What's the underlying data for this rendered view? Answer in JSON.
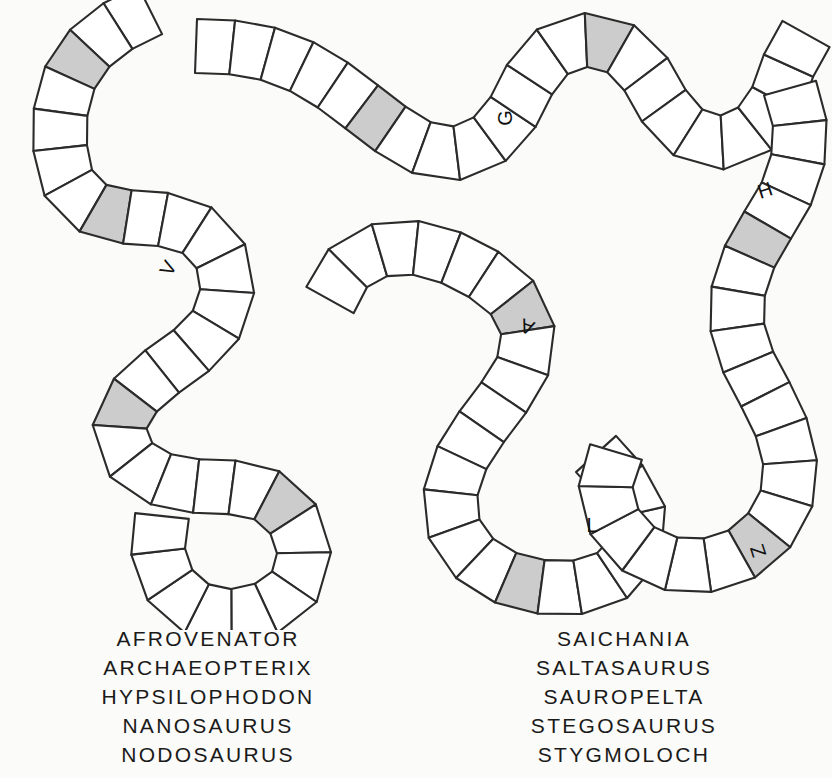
{
  "page": {
    "background_color": "#fbfbf9",
    "ink_color": "#2b2b2b",
    "shaded_cell_color": "#cccccc",
    "unshaded_cell_color": "#ffffff"
  },
  "track": {
    "description": "Two winding segmented snake-like tracks drawn as ribbons divided into rungs; a few cells are shaded gray and several cells carry single capital letters.",
    "letters": [
      {
        "char": "V",
        "shaded": false,
        "x": 168,
        "y": 268,
        "rotate": -62
      },
      {
        "char": "G",
        "shaded": false,
        "x": 505,
        "y": 118,
        "rotate": -90
      },
      {
        "char": "H",
        "shaded": true,
        "x": 765,
        "y": 190,
        "rotate": -18
      },
      {
        "char": "A",
        "shaded": true,
        "x": 527,
        "y": 327,
        "rotate": -160
      },
      {
        "char": "L",
        "shaded": false,
        "x": 592,
        "y": 525,
        "rotate": 0
      },
      {
        "char": "Z",
        "shaded": false,
        "x": 758,
        "y": 551,
        "rotate": -108
      }
    ],
    "shaded_cell_count": 10
  },
  "word_lists": {
    "left": {
      "heading": "",
      "words": [
        "AFROVENATOR",
        "ARCHAEOPTERIX",
        "HYPSILOPHODON",
        "NANOSAURUS",
        "NODOSAURUS"
      ]
    },
    "right": {
      "heading": "",
      "words": [
        "SAICHANIA",
        "SALTASAURUS",
        "SAUROPELTA",
        "STEGOSAURUS",
        "STYGMOLOCH"
      ]
    }
  }
}
